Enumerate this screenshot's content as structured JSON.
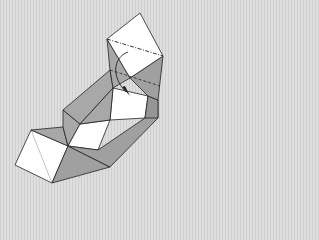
{
  "diagram": {
    "type": "origami-fold-step",
    "colors": {
      "background": "#d6d6d6",
      "paper_white": "#ffffff",
      "paper_shade": "#a8a8a8",
      "paper_shade_dark": "#969696",
      "line": "#222222",
      "crease": "#9a9a9a"
    },
    "annotations": {
      "fold_line": "dash-dot valley fold",
      "hidden_line": "dashed",
      "arrow": "fold-direction-arrow"
    }
  }
}
